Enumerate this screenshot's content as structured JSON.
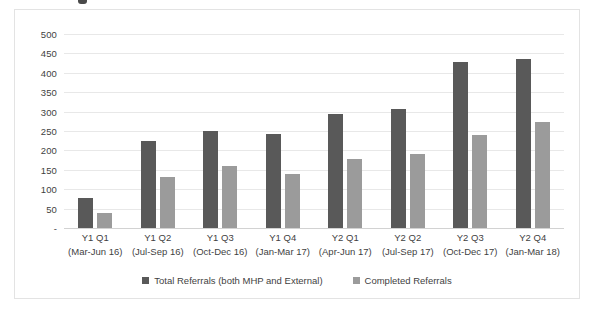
{
  "chart_data": {
    "type": "bar",
    "title": "",
    "subtitle": "",
    "xlabel": "",
    "ylabel": "",
    "ylim": [
      0,
      500
    ],
    "yticks": [
      0,
      50,
      100,
      150,
      200,
      250,
      300,
      350,
      400,
      450,
      500
    ],
    "ytick_labels": [
      "-",
      "50",
      "100",
      "150",
      "200",
      "250",
      "300",
      "350",
      "400",
      "450",
      "500"
    ],
    "grid": true,
    "legend_position": "bottom",
    "categories": [
      "Y1 Q1 (Mar-Jun 16)",
      "Y1 Q2 (Jul-Sep 16)",
      "Y1 Q3 (Oct-Dec 16)",
      "Y1 Q4 (Jan-Mar 17)",
      "Y2 Q1 (Apr-Jun 17)",
      "Y2 Q2 (Jul-Sep 17)",
      "Y2 Q3 (Oct-Dec 17)",
      "Y2 Q4 (Jan-Mar 18)"
    ],
    "category_lines": [
      {
        "period": "Y1 Q1",
        "range": "(Mar-Jun 16)"
      },
      {
        "period": "Y1 Q2",
        "range": "(Jul-Sep 16)"
      },
      {
        "period": "Y1 Q3",
        "range": "(Oct-Dec 16)"
      },
      {
        "period": "Y1 Q4",
        "range": "(Jan-Mar 17)"
      },
      {
        "period": "Y2 Q1",
        "range": "(Apr-Jun 17)"
      },
      {
        "period": "Y2 Q2",
        "range": "(Jul-Sep 17)"
      },
      {
        "period": "Y2 Q3",
        "range": "(Oct-Dec 17)"
      },
      {
        "period": "Y2 Q4",
        "range": "(Jan-Mar 18)"
      }
    ],
    "series": [
      {
        "name": "Total Referrals (both MHP and External)",
        "color": "#595959",
        "values": [
          77,
          224,
          250,
          242,
          294,
          307,
          428,
          436
        ]
      },
      {
        "name": "Completed Referrals",
        "color": "#9b9b9b",
        "values": [
          39,
          131,
          160,
          139,
          178,
          191,
          240,
          273
        ]
      }
    ]
  },
  "legend": {
    "items": [
      {
        "label": "Total Referrals (both MHP and External)",
        "color": "#595959"
      },
      {
        "label": "Completed Referrals",
        "color": "#9b9b9b"
      }
    ]
  },
  "colors": {
    "total_referrals": "#595959",
    "completed_referrals": "#9b9b9b",
    "gridline": "#e8e8e8",
    "border": "#e3e3e3",
    "text": "#3f3f3f",
    "background": "#ffffff"
  }
}
